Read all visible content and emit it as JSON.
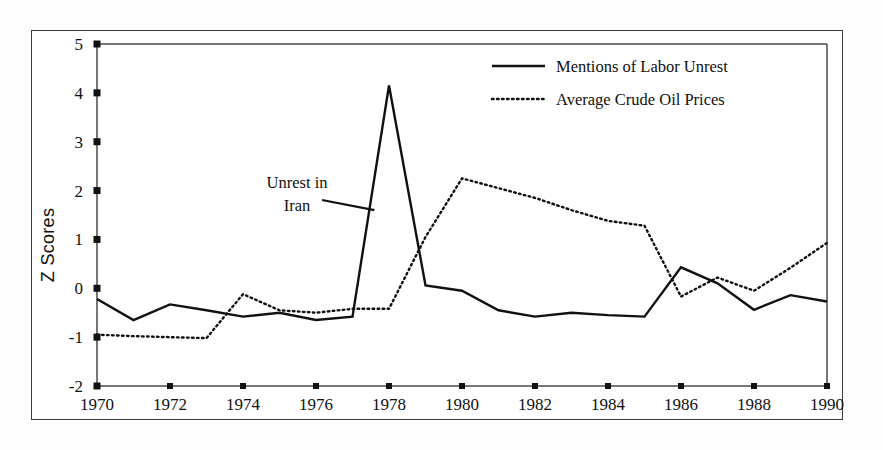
{
  "chart_data": {
    "type": "line",
    "title": "",
    "xlabel": "",
    "ylabel": "Z Scores",
    "xlim": [
      1970,
      1990
    ],
    "ylim": [
      -2,
      5
    ],
    "xticks": [
      1970,
      1972,
      1974,
      1976,
      1978,
      1980,
      1982,
      1984,
      1986,
      1988,
      1990
    ],
    "xtick_labels": [
      "1970",
      "1972",
      "1974",
      "1976",
      "1978",
      "1980",
      "1982",
      "1984",
      "1986",
      "1988",
      "1990"
    ],
    "yticks": [
      -2,
      -1,
      0,
      1,
      2,
      3,
      4,
      5
    ],
    "ytick_labels": [
      "-2",
      "-1",
      "0",
      "1",
      "2",
      "3",
      "4",
      "5"
    ],
    "grid": false,
    "legend_position": "top-right",
    "x": [
      1970,
      1971,
      1972,
      1973,
      1974,
      1975,
      1976,
      1977,
      1978,
      1979,
      1980,
      1981,
      1982,
      1983,
      1984,
      1985,
      1986,
      1987,
      1988,
      1989,
      1990
    ],
    "series": [
      {
        "name": "Mentions of Labor Unrest",
        "style": "solid",
        "values": [
          -0.22,
          -0.65,
          -0.33,
          -0.45,
          -0.58,
          -0.5,
          -0.65,
          -0.58,
          4.15,
          0.06,
          -0.05,
          -0.45,
          -0.58,
          -0.5,
          -0.55,
          -0.58,
          0.43,
          0.1,
          -0.44,
          -0.14,
          -0.27
        ]
      },
      {
        "name": "Average Crude Oil Prices",
        "style": "dotted",
        "values": [
          -0.95,
          -0.98,
          -1.0,
          -1.02,
          -0.12,
          -0.45,
          -0.5,
          -0.42,
          -0.42,
          1.05,
          2.25,
          2.05,
          1.85,
          1.6,
          1.38,
          1.28,
          -0.17,
          0.22,
          -0.05,
          0.42,
          0.93
        ]
      }
    ],
    "annotations": [
      {
        "text_line1": "Unrest in",
        "text_line2": "Iran",
        "points_to_x": 1977.6,
        "points_to_y": 1.6
      }
    ]
  }
}
